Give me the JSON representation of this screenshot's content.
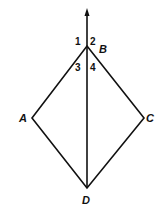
{
  "diagram": {
    "points": {
      "A": {
        "label": "A",
        "x": 32,
        "y": 118
      },
      "B": {
        "label": "B",
        "x": 87,
        "y": 46
      },
      "C": {
        "label": "C",
        "x": 144,
        "y": 118
      },
      "D": {
        "label": "D",
        "x": 87,
        "y": 188
      }
    },
    "ray_top": {
      "x": 87,
      "y": 10
    },
    "angles": {
      "a1": "1",
      "a2": "2",
      "a3": "3",
      "a4": "4"
    },
    "stroke_color": "#111111"
  }
}
